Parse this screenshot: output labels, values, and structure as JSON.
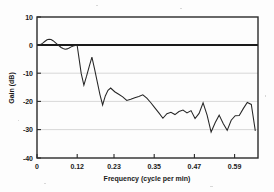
{
  "figure": {
    "background_color": "#fdfdfd",
    "frame_color": "#2a2a2a",
    "grid_color": "#c9c9c9",
    "line_color": "#262626"
  },
  "axis": {
    "y_title": "Gain (dB)",
    "x_title": "Frequency (cycle per min)",
    "y_ticks": [
      "10",
      "0",
      "-10",
      "-20",
      "-30",
      "-40"
    ],
    "x_ticks": [
      "0",
      "0.12",
      "0.23",
      "0.35",
      "0.47",
      "0.59"
    ]
  },
  "chart_data": {
    "type": "line",
    "title": "",
    "subtitle": "",
    "xlabel": "Frequency (cycle per min)",
    "ylabel": "Gain (dB)",
    "xlim": [
      0,
      0.66
    ],
    "ylim": [
      -40,
      10
    ],
    "xticks": [
      0,
      0.12,
      0.23,
      0.35,
      0.47,
      0.59
    ],
    "yticks": [
      10,
      0,
      -10,
      -20,
      -30,
      -40
    ],
    "grid": "horizontal",
    "gridlines_y": [
      -10,
      -20,
      -30
    ],
    "reference_line_y": 0,
    "legend": null,
    "legend_position": "none",
    "series": [
      {
        "name": "Gain magnitude",
        "x": [
          0.0,
          0.006,
          0.012,
          0.018,
          0.024,
          0.03,
          0.036,
          0.042,
          0.048,
          0.054,
          0.06,
          0.066,
          0.072,
          0.078,
          0.084,
          0.09,
          0.096,
          0.102,
          0.108,
          0.114,
          0.12,
          0.126,
          0.132,
          0.14,
          0.148,
          0.156,
          0.164,
          0.172,
          0.18,
          0.188,
          0.196,
          0.204,
          0.212,
          0.22,
          0.232,
          0.244,
          0.256,
          0.268,
          0.28,
          0.292,
          0.304,
          0.316,
          0.328,
          0.34,
          0.352,
          0.364,
          0.376,
          0.388,
          0.4,
          0.412,
          0.424,
          0.436,
          0.448,
          0.46,
          0.472,
          0.484,
          0.496,
          0.508,
          0.52,
          0.532,
          0.544,
          0.556,
          0.568,
          0.58,
          0.592,
          0.604,
          0.616,
          0.628,
          0.64,
          0.652
        ],
        "y": [
          0.0,
          0.1,
          0.3,
          0.8,
          1.4,
          1.9,
          2.1,
          2.0,
          1.6,
          1.0,
          0.4,
          -0.2,
          -0.8,
          -1.2,
          -1.4,
          -1.3,
          -1.0,
          -0.6,
          -0.3,
          -0.1,
          -0.1,
          -5.0,
          -10.0,
          -14.2,
          -11.0,
          -7.5,
          -4.2,
          -8.5,
          -13.0,
          -17.5,
          -21.2,
          -18.0,
          -16.0,
          -15.2,
          -16.5,
          -17.4,
          -18.3,
          -19.6,
          -19.2,
          -18.6,
          -18.2,
          -17.6,
          -18.8,
          -20.4,
          -22.2,
          -24.0,
          -25.9,
          -24.3,
          -23.8,
          -24.6,
          -23.5,
          -23.0,
          -24.0,
          -23.2,
          -26.0,
          -24.2,
          -20.4,
          -24.8,
          -30.8,
          -27.5,
          -24.8,
          -27.8,
          -30.2,
          -26.6,
          -25.0,
          -24.9,
          -22.5,
          -20.3,
          -21.0,
          -30.4
        ]
      }
    ],
    "annotations": []
  }
}
